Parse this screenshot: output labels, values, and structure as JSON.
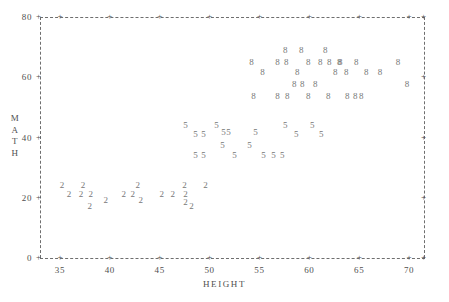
{
  "chart_data": {
    "type": "scatter",
    "title": "",
    "xlabel": "HEIGHT",
    "ylabel": "MATH",
    "xlim": [
      33,
      71.5
    ],
    "ylim": [
      0,
      80
    ],
    "xticks": [
      35,
      40,
      45,
      50,
      55,
      60,
      65,
      70
    ],
    "yticks": [
      0,
      20,
      40,
      60,
      80
    ],
    "grid": false,
    "legend": "none",
    "plot_symbols": [
      "2",
      "5",
      "8"
    ],
    "note": "Character scatter plot; plotting symbol denotes group (2, 5, 8).",
    "series": [
      {
        "name": "2",
        "symbol": "2",
        "points": [
          [
            35.2,
            24.0
          ],
          [
            35.9,
            21.0
          ],
          [
            37.3,
            24.0
          ],
          [
            37.1,
            21.0
          ],
          [
            38.1,
            21.0
          ],
          [
            38.0,
            17.0
          ],
          [
            39.6,
            19.0
          ],
          [
            41.4,
            21.0
          ],
          [
            42.3,
            21.0
          ],
          [
            42.8,
            24.0
          ],
          [
            43.1,
            19.0
          ],
          [
            45.2,
            21.0
          ],
          [
            46.3,
            21.0
          ],
          [
            47.5,
            24.0
          ],
          [
            47.6,
            21.0
          ],
          [
            47.6,
            18.5
          ],
          [
            48.2,
            17.0
          ],
          [
            49.6,
            24.0
          ]
        ]
      },
      {
        "name": "5",
        "symbol": "5",
        "points": [
          [
            47.6,
            44.0
          ],
          [
            48.6,
            41.0
          ],
          [
            49.4,
            41.0
          ],
          [
            48.6,
            34.0
          ],
          [
            49.4,
            34.0
          ],
          [
            50.7,
            44.0
          ],
          [
            51.4,
            41.5
          ],
          [
            51.9,
            41.5
          ],
          [
            51.3,
            37.5
          ],
          [
            52.5,
            34.0
          ],
          [
            54.6,
            41.5
          ],
          [
            54.0,
            37.5
          ],
          [
            55.4,
            34.0
          ],
          [
            56.4,
            34.0
          ],
          [
            57.3,
            34.0
          ],
          [
            57.6,
            44.0
          ],
          [
            58.7,
            41.0
          ],
          [
            60.3,
            44.0
          ],
          [
            61.2,
            41.0
          ]
        ]
      },
      {
        "name": "8",
        "symbol": "8",
        "points": [
          [
            54.2,
            65.0
          ],
          [
            55.3,
            61.5
          ],
          [
            54.4,
            53.5
          ],
          [
            57.6,
            69.0
          ],
          [
            59.2,
            69.0
          ],
          [
            56.8,
            65.0
          ],
          [
            57.7,
            65.0
          ],
          [
            58.8,
            61.5
          ],
          [
            58.5,
            57.5
          ],
          [
            59.3,
            57.5
          ],
          [
            56.8,
            53.5
          ],
          [
            57.8,
            53.5
          ],
          [
            61.6,
            69.0
          ],
          [
            59.9,
            65.0
          ],
          [
            61.1,
            65.0
          ],
          [
            62.0,
            65.0
          ],
          [
            63.0,
            65.0
          ],
          [
            60.6,
            57.5
          ],
          [
            62.6,
            61.5
          ],
          [
            59.9,
            53.5
          ],
          [
            63.1,
            65.0
          ],
          [
            63.7,
            61.5
          ],
          [
            64.7,
            65.0
          ],
          [
            65.7,
            61.5
          ],
          [
            61.9,
            53.5
          ],
          [
            63.8,
            53.5
          ],
          [
            64.6,
            53.5
          ],
          [
            65.2,
            53.5
          ],
          [
            67.1,
            61.5
          ],
          [
            68.9,
            65.0
          ],
          [
            69.8,
            57.5
          ]
        ]
      }
    ]
  }
}
